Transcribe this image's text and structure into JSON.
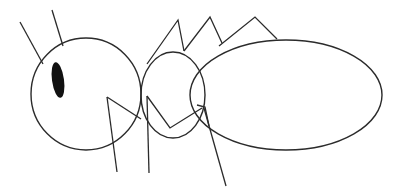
{
  "canvas": {
    "width": 403,
    "height": 196,
    "background_color": "#ffffff",
    "subject": "ant-line-drawing",
    "description": "Simple black line drawing of an ant seen from the side, made of three body ovals, two antennae, six legs and one filled eye"
  },
  "style": {
    "stroke_color": "#2b2b2b",
    "eye_fill_color": "#111111",
    "body_fill": "none",
    "stroke_width": 1.4,
    "leg_stroke_width": 1.3
  },
  "parts": {
    "head": {
      "name": "head",
      "shape": "ellipse",
      "cx": 86,
      "cy": 94,
      "rx": 55,
      "ry": 56
    },
    "thorax": {
      "name": "thorax",
      "shape": "ellipse",
      "cx": 173,
      "cy": 95,
      "rx": 32,
      "ry": 43
    },
    "abdomen": {
      "name": "abdomen",
      "shape": "ellipse",
      "cx": 286,
      "cy": 95,
      "rx": 96,
      "ry": 55
    },
    "eye": {
      "name": "eye",
      "shape": "ellipse",
      "cx": 58,
      "cy": 80,
      "rx": 6,
      "ry": 18,
      "rotation": -8
    }
  },
  "antennae": [
    {
      "name": "antenna-left",
      "points": "20,22 43,64"
    },
    {
      "name": "antenna-right",
      "points": "52,10 63,46"
    }
  ],
  "legs": [
    {
      "name": "upper-leg-front",
      "points": "147,64 178,20 184,51"
    },
    {
      "name": "upper-leg-middle",
      "points": "184,51 210,17 222,43"
    },
    {
      "name": "upper-leg-rear",
      "points": "219,46 255,17 277,39"
    },
    {
      "name": "lower-leg-front-joint",
      "points": "107,97 141,119"
    },
    {
      "name": "lower-leg-front-shaft",
      "points": "107,97 117,172"
    },
    {
      "name": "lower-leg-middle-joint",
      "points": "147,96 170,128 202,108"
    },
    {
      "name": "lower-leg-middle-shaft",
      "points": "147,96 149,173"
    },
    {
      "name": "lower-leg-rear-joint",
      "points": "197,105 205,107 209,126"
    },
    {
      "name": "lower-leg-rear-shaft",
      "points": "204,108 226,186"
    }
  ]
}
